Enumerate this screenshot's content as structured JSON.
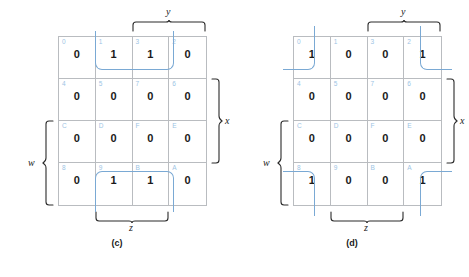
{
  "figure": {
    "accent_color": "#7aa9d4",
    "cell_index_color": "#9dc4e4",
    "grid_line_color": "#b9bcc0",
    "value_color": "#1a1a1a"
  },
  "variables": {
    "y": "y",
    "x": "x",
    "w": "w",
    "z": "z"
  },
  "maps": [
    {
      "id": "c",
      "caption": "(c)",
      "cells": [
        {
          "index": "0",
          "value": "0"
        },
        {
          "index": "1",
          "value": "1"
        },
        {
          "index": "3",
          "value": "1"
        },
        {
          "index": "2",
          "value": "0"
        },
        {
          "index": "4",
          "value": "0"
        },
        {
          "index": "5",
          "value": "0"
        },
        {
          "index": "7",
          "value": "0"
        },
        {
          "index": "6",
          "value": "0"
        },
        {
          "index": "C",
          "value": "0"
        },
        {
          "index": "D",
          "value": "0"
        },
        {
          "index": "F",
          "value": "0"
        },
        {
          "index": "E",
          "value": "0"
        },
        {
          "index": "8",
          "value": "0"
        },
        {
          "index": "9",
          "value": "1"
        },
        {
          "index": "B",
          "value": "1"
        },
        {
          "index": "A",
          "value": "0"
        }
      ],
      "groups": [
        {
          "name": "top-group-cells-1-3",
          "cells": [
            "1",
            "3"
          ]
        },
        {
          "name": "bottom-group-cells-9-B",
          "cells": [
            "9",
            "B"
          ]
        }
      ]
    },
    {
      "id": "d",
      "caption": "(d)",
      "cells": [
        {
          "index": "0",
          "value": "1"
        },
        {
          "index": "1",
          "value": "0"
        },
        {
          "index": "3",
          "value": "0"
        },
        {
          "index": "2",
          "value": "1"
        },
        {
          "index": "4",
          "value": "0"
        },
        {
          "index": "5",
          "value": "0"
        },
        {
          "index": "7",
          "value": "0"
        },
        {
          "index": "6",
          "value": "0"
        },
        {
          "index": "C",
          "value": "0"
        },
        {
          "index": "D",
          "value": "0"
        },
        {
          "index": "F",
          "value": "0"
        },
        {
          "index": "E",
          "value": "0"
        },
        {
          "index": "8",
          "value": "1"
        },
        {
          "index": "9",
          "value": "0"
        },
        {
          "index": "B",
          "value": "0"
        },
        {
          "index": "A",
          "value": "1"
        }
      ],
      "groups": [
        {
          "name": "corner-group-cells-0-2-8-A",
          "cells": [
            "0",
            "2",
            "8",
            "A"
          ]
        }
      ]
    }
  ]
}
